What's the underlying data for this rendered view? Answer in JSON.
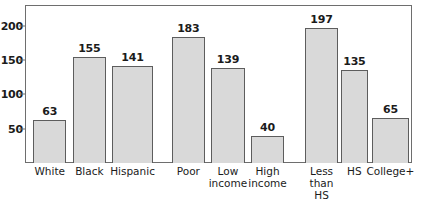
{
  "chart_data": {
    "type": "bar",
    "title": "",
    "subtitle": "",
    "xlabel": "",
    "ylabel": "",
    "categories": [
      "White",
      "Black",
      "Hispanic",
      "Poor",
      "Low\nincome",
      "High\nincome",
      "Less\nthan\nHS",
      "HS",
      "College+"
    ],
    "values": [
      63,
      155,
      141,
      183,
      139,
      40,
      197,
      135,
      65
    ],
    "value_labels": [
      "63",
      "155",
      "141",
      "183",
      "139",
      "40",
      "197",
      "135",
      "65"
    ],
    "groups": [
      {
        "name": "race-ethnicity",
        "categories": [
          "White",
          "Black",
          "Hispanic"
        ]
      },
      {
        "name": "income",
        "categories": [
          "Poor",
          "Low income",
          "High income"
        ]
      },
      {
        "name": "education",
        "categories": [
          "Less than HS",
          "HS",
          "College+"
        ]
      }
    ],
    "ylim": [
      0,
      230
    ],
    "yticks": [
      50,
      100,
      150,
      200
    ],
    "ytick_labels": [
      "50",
      "100",
      "150",
      "200"
    ],
    "grid": false,
    "legend": null,
    "legend_position": "none",
    "bar_fill_color": "#d9d9d9",
    "bar_border_color": "#5d5d5d",
    "axis_color": "#6e6e6e",
    "text_color": "#1b1b1b",
    "background_color": "#ffffff"
  },
  "axis": {
    "y_ticks": [
      {
        "label": "200",
        "value": 200
      },
      {
        "label": "150",
        "value": 150
      },
      {
        "label": "100",
        "value": 100
      },
      {
        "label": "50",
        "value": 50
      }
    ]
  },
  "bars": [
    {
      "label": "White",
      "value": 63,
      "value_label": "63",
      "group": 0
    },
    {
      "label": "Black",
      "value": 155,
      "value_label": "155",
      "group": 0
    },
    {
      "label": "Hispanic",
      "value": 141,
      "value_label": "141",
      "group": 0
    },
    {
      "label": "Poor",
      "value": 183,
      "value_label": "183",
      "group": 1
    },
    {
      "label": "Low\nincome",
      "value": 139,
      "value_label": "139",
      "group": 1
    },
    {
      "label": "High\nincome",
      "value": 40,
      "value_label": "40",
      "group": 1
    },
    {
      "label": "Less\nthan\nHS",
      "value": 197,
      "value_label": "197",
      "group": 2
    },
    {
      "label": "HS",
      "value": 135,
      "value_label": "135",
      "group": 2
    },
    {
      "label": "College+",
      "value": 65,
      "value_label": "65",
      "group": 2
    }
  ]
}
